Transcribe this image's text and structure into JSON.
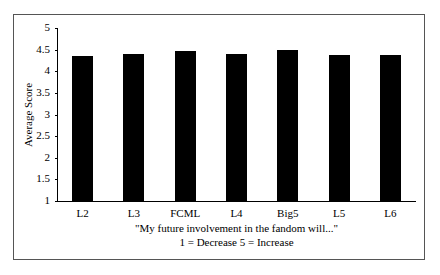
{
  "chart_data": {
    "type": "bar",
    "title": "",
    "xlabel": "\"My future involvement in the fandom will...\"",
    "xlabel_line2": "1 = Decrease 5 = Increase",
    "ylabel": "Average Score",
    "ylim": [
      1,
      5
    ],
    "yticks": [
      "5",
      "4.5",
      "4",
      "3.5",
      "3",
      "2.5",
      "2",
      "1.5",
      "1"
    ],
    "categories": [
      "L2",
      "L3",
      "FCML",
      "L4",
      "Big5",
      "L5",
      "L6"
    ],
    "values": [
      4.36,
      4.4,
      4.46,
      4.4,
      4.48,
      4.38,
      4.38
    ],
    "grid": false,
    "legend": null,
    "bar_color": "#000000"
  }
}
